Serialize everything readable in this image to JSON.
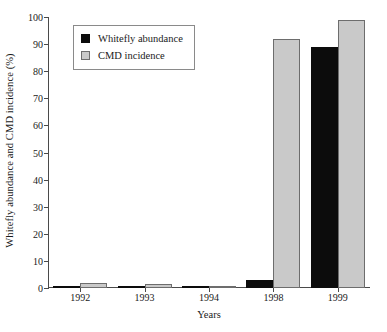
{
  "chart_data": {
    "type": "bar",
    "title": "",
    "xlabel": "Years",
    "ylabel": "Whitefly abundance and CMD incidence (%)",
    "categories": [
      "1992",
      "1993",
      "1994",
      "1998",
      "1999"
    ],
    "series": [
      {
        "name": "Whitefly abundance",
        "color": "#0c0c0c",
        "values": [
          0.8,
          0.3,
          0.3,
          3,
          89
        ]
      },
      {
        "name": "CMD incidence",
        "color": "#c9c9c9",
        "values": [
          2,
          1.5,
          0.2,
          92,
          99
        ]
      }
    ],
    "ylim": [
      0,
      100
    ],
    "yticks": [
      0,
      10,
      20,
      30,
      40,
      50,
      60,
      70,
      80,
      90,
      100
    ],
    "ytick_labels": [
      "0",
      "10",
      "20",
      "30",
      "40",
      "50",
      "60",
      "70",
      "80",
      "90",
      "100"
    ],
    "grid": false,
    "legend_position": "upper left"
  },
  "legend": {
    "entries": [
      {
        "label": "Whitefly abundance",
        "swatch": "black-square-icon"
      },
      {
        "label": "CMD incidence",
        "swatch": "gray-square-icon"
      }
    ]
  },
  "axes": {
    "y_title": "Whitefly abundance and CMD incidence (%)",
    "x_title": "Years"
  }
}
